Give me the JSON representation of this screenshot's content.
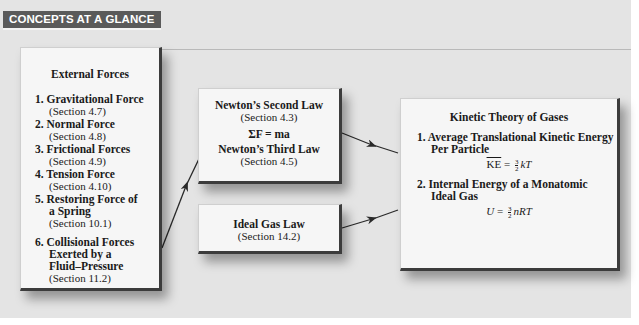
{
  "header": {
    "title": "CONCEPTS AT A GLANCE"
  },
  "colors": {
    "panel_bg": "#e4e4e4",
    "header_bg": "#5a5a5a",
    "header_text": "#ffffff",
    "box_bg": "#f6f6f6",
    "box_edge": "#3c3c3c"
  },
  "external_forces": {
    "title": "External Forces",
    "items": [
      {
        "label": "1. Gravitational Force",
        "section": "(Section 4.7)"
      },
      {
        "label": "2. Normal Force",
        "section": "(Section 4.8)"
      },
      {
        "label": "3. Frictional Forces",
        "section": "(Section 4.9)"
      },
      {
        "label": "4. Tension Force",
        "section": "(Section 4.10)"
      },
      {
        "label_line1": "5. Restoring Force of",
        "label_line2": "a Spring",
        "section": "(Section 10.1)"
      },
      {
        "label_line1": "6. Collisional Forces",
        "label_line2": "Exerted by a",
        "label_line3": "Fluid–Pressure",
        "section": "(Section 11.2)"
      }
    ]
  },
  "newton": {
    "second_law": "Newton’s Second Law",
    "second_section": "(Section 4.3)",
    "equation": "ΣF = ma",
    "third_law": "Newton’s Third Law",
    "third_section": "(Section 4.5)"
  },
  "ideal_gas": {
    "title": "Ideal Gas Law",
    "section": "(Section 14.2)"
  },
  "kinetic": {
    "title": "Kinetic Theory of Gases",
    "item1_line1": "1. Average Translational Kinetic Energy",
    "item1_line2": "Per Particle",
    "eq1_lhs": "KE",
    "eq1_eq": " = ",
    "eq1_num": "3",
    "eq1_den": "2",
    "eq1_rhs": "kT",
    "item2_line1": "2. Internal Energy of a Monatomic",
    "item2_line2": "Ideal Gas",
    "eq2_lhs": "U",
    "eq2_eq": " = ",
    "eq2_num": "3",
    "eq2_den": "2",
    "eq2_rhs": "nRT"
  }
}
